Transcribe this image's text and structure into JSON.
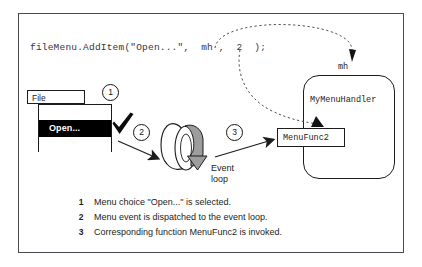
{
  "figure": {
    "code_line": "fileMenu.AddItem(\"Open...\",  mh ,  2  );",
    "menu": {
      "title": "File",
      "selected_item": "Open..."
    },
    "event_loop": {
      "label_line1": "Event",
      "label_line2": "loop"
    },
    "handler": {
      "pointer_label": "mh",
      "class_label": "MyMenuHandler",
      "function_label": "MenuFunc2"
    },
    "steps": [
      {
        "number": "1"
      },
      {
        "number": "2"
      },
      {
        "number": "3"
      }
    ],
    "legend": [
      {
        "number": "1",
        "text": "Menu choice \"Open...\" is selected."
      },
      {
        "number": "2",
        "text": "Menu event is dispatched to the event loop."
      },
      {
        "number": "3",
        "text": "Corresponding function MenuFunc2 is invoked."
      }
    ],
    "colors": {
      "frame_border": "#4a4a52",
      "ink": "#1c1c1c",
      "code_ink": "#35353a",
      "highlight_bg": "#000000",
      "highlight_fg": "#ffffff",
      "loop_shade": "#9d9d9d",
      "background": "#ffffff"
    }
  }
}
